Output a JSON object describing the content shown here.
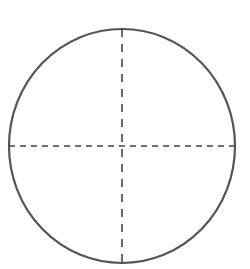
{
  "diagram": {
    "type": "circle-with-crosshair",
    "width": 250,
    "height": 269,
    "background": "#ffffff",
    "circle": {
      "cx": 122,
      "cy": 146,
      "rx": 113,
      "ry": 117,
      "stroke": "#555555",
      "stroke_width": 2.2
    },
    "horizontal_diameter": {
      "x1": 9,
      "y1": 146,
      "x2": 235,
      "y2": 146,
      "stroke": "#444444",
      "stroke_width": 1.6,
      "dash": "6 5"
    },
    "vertical_diameter": {
      "x1": 122,
      "y1": 29,
      "x2": 122,
      "y2": 263,
      "stroke": "#444444",
      "stroke_width": 1.6,
      "dash": "8 7"
    }
  }
}
